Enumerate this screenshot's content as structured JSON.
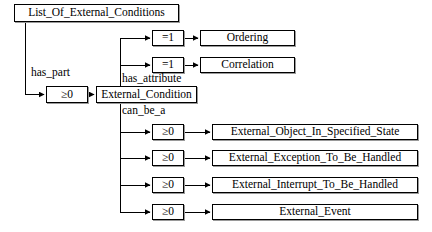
{
  "diagram": {
    "type": "entity-relationship-tree",
    "root": {
      "label": "List_Of_External_Conditions"
    },
    "nodes": [
      {
        "id": "root",
        "label": "List_Of_External_Conditions",
        "kind": "entity",
        "x": 14,
        "y": 4,
        "w": 165,
        "h": 18
      },
      {
        "id": "card_part",
        "label": "≥0",
        "kind": "cardinality",
        "x": 46,
        "y": 86,
        "w": 42,
        "h": 17
      },
      {
        "id": "extcond",
        "label": "External_Condition",
        "kind": "entity",
        "x": 96,
        "y": 86,
        "w": 101,
        "h": 17
      },
      {
        "id": "card_attr1",
        "label": "=1",
        "kind": "cardinality",
        "x": 152,
        "y": 30,
        "w": 32,
        "h": 16
      },
      {
        "id": "card_attr2",
        "label": "=1",
        "kind": "cardinality",
        "x": 152,
        "y": 57,
        "w": 32,
        "h": 16
      },
      {
        "id": "ordering",
        "label": "Ordering",
        "kind": "entity",
        "x": 200,
        "y": 30,
        "w": 95,
        "h": 16
      },
      {
        "id": "correlation",
        "label": "Correlation",
        "kind": "entity",
        "x": 200,
        "y": 57,
        "w": 95,
        "h": 16
      },
      {
        "id": "card_be1",
        "label": "≥0",
        "kind": "cardinality",
        "x": 152,
        "y": 124,
        "w": 32,
        "h": 16
      },
      {
        "id": "card_be2",
        "label": "≥0",
        "kind": "cardinality",
        "x": 152,
        "y": 150,
        "w": 32,
        "h": 16
      },
      {
        "id": "card_be3",
        "label": "≥0",
        "kind": "cardinality",
        "x": 152,
        "y": 177,
        "w": 32,
        "h": 16
      },
      {
        "id": "card_be4",
        "label": "≥0",
        "kind": "cardinality",
        "x": 152,
        "y": 204,
        "w": 32,
        "h": 16
      },
      {
        "id": "obj_state",
        "label": "External_Object_In_Specified_State",
        "kind": "entity",
        "x": 212,
        "y": 124,
        "w": 206,
        "h": 16
      },
      {
        "id": "exception",
        "label": "External_Exception_To_Be_Handled",
        "kind": "entity",
        "x": 212,
        "y": 150,
        "w": 206,
        "h": 16
      },
      {
        "id": "interrupt",
        "label": "External_Interrupt_To_Be_Handled",
        "kind": "entity",
        "x": 212,
        "y": 177,
        "w": 206,
        "h": 16
      },
      {
        "id": "event",
        "label": "External_Event",
        "kind": "entity",
        "x": 212,
        "y": 204,
        "w": 206,
        "h": 16
      }
    ],
    "edge_labels": [
      {
        "id": "has_part",
        "text": "has_part",
        "x": 31,
        "y": 67
      },
      {
        "id": "has_attribute",
        "text": "has_attribute",
        "x": 122,
        "y": 73
      },
      {
        "id": "can_be_a",
        "text": "can_be_a",
        "x": 122,
        "y": 105
      }
    ],
    "colors": {
      "background": "#ffffff",
      "stroke": "#000000",
      "shadow": "#9a9a9a",
      "text": "#000000"
    }
  }
}
